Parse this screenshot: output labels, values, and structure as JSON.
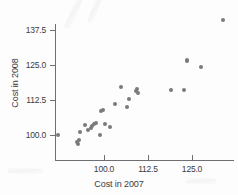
{
  "figure": {
    "background": "#fdfdfd",
    "point_color": "#7a7a7e",
    "axis_color": "#6e6e73"
  },
  "chart_data": {
    "type": "scatter",
    "title": "",
    "xlabel": "Cost in 2007",
    "ylabel": "Cost in 2008",
    "xticks": [
      "100.0",
      "112.5",
      "125.0"
    ],
    "yticks": [
      "100.0",
      "112.5",
      "125.0",
      "137.5"
    ],
    "xtick_values": [
      100.0,
      112.5,
      125.0
    ],
    "ytick_values": [
      100.0,
      112.5,
      125.0,
      137.5
    ],
    "xlim": [
      86.0,
      135.0
    ],
    "ylim": [
      95.0,
      143.0
    ],
    "grid": false,
    "legend": null,
    "marker": "circle",
    "points": [
      {
        "x": 86.9,
        "y": 100.0
      },
      {
        "x": 92.3,
        "y": 97.4
      },
      {
        "x": 92.5,
        "y": 96.8
      },
      {
        "x": 92.8,
        "y": 98.3
      },
      {
        "x": 93.1,
        "y": 101.1
      },
      {
        "x": 94.6,
        "y": 103.6
      },
      {
        "x": 95.4,
        "y": 101.8
      },
      {
        "x": 96.2,
        "y": 102.5
      },
      {
        "x": 96.6,
        "y": 103.2
      },
      {
        "x": 97.1,
        "y": 103.9
      },
      {
        "x": 97.7,
        "y": 104.3
      },
      {
        "x": 98.9,
        "y": 100.0
      },
      {
        "x": 99.2,
        "y": 108.6
      },
      {
        "x": 99.8,
        "y": 109.0
      },
      {
        "x": 100.2,
        "y": 103.9
      },
      {
        "x": 101.6,
        "y": 102.9
      },
      {
        "x": 103.0,
        "y": 111.2
      },
      {
        "x": 104.8,
        "y": 117.2
      },
      {
        "x": 106.6,
        "y": 110.1
      },
      {
        "x": 107.0,
        "y": 113.0
      },
      {
        "x": 109.1,
        "y": 115.8
      },
      {
        "x": 109.3,
        "y": 116.5
      },
      {
        "x": 109.6,
        "y": 115.1
      },
      {
        "x": 119.0,
        "y": 116.2
      },
      {
        "x": 122.8,
        "y": 116.2
      },
      {
        "x": 123.5,
        "y": 126.6
      },
      {
        "x": 127.5,
        "y": 124.3
      },
      {
        "x": 133.8,
        "y": 141.2
      }
    ]
  }
}
